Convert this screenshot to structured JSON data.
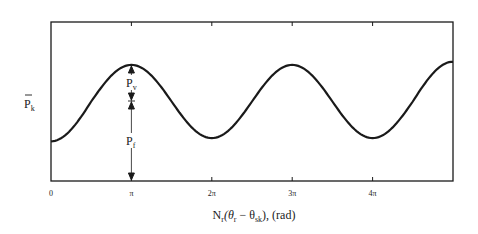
{
  "chart_data": {
    "type": "line",
    "title": "",
    "xlabel": "N_r(θ_r − θ_sk), (rad)",
    "xlabel_parts": {
      "N": "N",
      "N_sub": "r",
      "open": "(θ",
      "theta_r_sub": "r",
      "minus": " − θ",
      "theta_sk_sub": "sk",
      "close": "), (rad)"
    },
    "ylabel": "P̄_k",
    "ylabel_parts": {
      "P": "P",
      "sub": "k"
    },
    "x_ticks": [
      "0",
      "π",
      "2π",
      "3π",
      "4π"
    ],
    "x_tick_values": [
      0,
      3.1416,
      6.2832,
      9.4248,
      12.5664
    ],
    "xlim": [
      0,
      15.708
    ],
    "ylim": [
      0,
      1
    ],
    "grid": false,
    "legend": null,
    "series": [
      {
        "name": "P̄_k",
        "description": "sinusoid: P_f + P_v·(1 − cos x)/2 style, minima at 0, 2π, 4π; maxima at π, 3π, 5π",
        "x": [
          0,
          1.5708,
          3.1416,
          4.7124,
          6.2832,
          7.854,
          9.4248,
          10.9956,
          12.5664,
          14.1372,
          15.708
        ],
        "y": [
          0.25,
          0.5,
          0.73,
          0.5,
          0.27,
          0.5,
          0.73,
          0.5,
          0.27,
          0.5,
          0.75
        ]
      }
    ],
    "annotations": [
      {
        "text": "P_v",
        "label": "P",
        "sub": "v",
        "at_x": "π",
        "meaning": "variable part: from mid-level up to peak, double-arrow"
      },
      {
        "text": "P_f",
        "label": "P",
        "sub": "f",
        "at_x": "π",
        "meaning": "fixed part: from axis baseline up to mid-level, double-arrow"
      }
    ]
  }
}
